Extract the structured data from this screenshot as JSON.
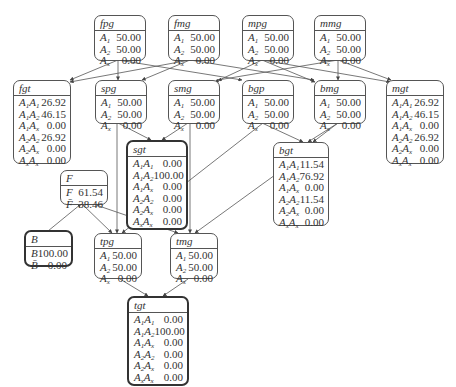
{
  "diagram": {
    "type": "bayesian-network",
    "nodes": {
      "fpg": {
        "title": "fpg",
        "rows": [
          {
            "label": "A1",
            "value": "50.00"
          },
          {
            "label": "A2",
            "value": "50.00"
          },
          {
            "label": "Ax",
            "value": "0.00"
          }
        ]
      },
      "fmg": {
        "title": "fmg",
        "rows": [
          {
            "label": "A1",
            "value": "50.00"
          },
          {
            "label": "A2",
            "value": "50.00"
          },
          {
            "label": "Ax",
            "value": "0.00"
          }
        ]
      },
      "mpg": {
        "title": "mpg",
        "rows": [
          {
            "label": "A1",
            "value": "50.00"
          },
          {
            "label": "A2",
            "value": "50.00"
          },
          {
            "label": "Ax",
            "value": "0.00"
          }
        ]
      },
      "mmg": {
        "title": "mmg",
        "rows": [
          {
            "label": "A1",
            "value": "50.00"
          },
          {
            "label": "A2",
            "value": "50.00"
          },
          {
            "label": "Ax",
            "value": "0.00"
          }
        ]
      },
      "fgt": {
        "title": "fgt",
        "rows": [
          {
            "label": "A1A1",
            "value": "26.92"
          },
          {
            "label": "A1A2",
            "value": "46.15"
          },
          {
            "label": "A1Ax",
            "value": "0.00"
          },
          {
            "label": "A2A2",
            "value": "26.92"
          },
          {
            "label": "A2Ax",
            "value": "0.00"
          },
          {
            "label": "AxAx",
            "value": "0.00"
          }
        ]
      },
      "spg": {
        "title": "spg",
        "rows": [
          {
            "label": "A1",
            "value": "50.00"
          },
          {
            "label": "A2",
            "value": "50.00"
          },
          {
            "label": "Ax",
            "value": "0.00"
          }
        ]
      },
      "smg": {
        "title": "smg",
        "rows": [
          {
            "label": "A1",
            "value": "50.00"
          },
          {
            "label": "A2",
            "value": "50.00"
          },
          {
            "label": "Ax",
            "value": "0.00"
          }
        ]
      },
      "bgp": {
        "title": "bgp",
        "rows": [
          {
            "label": "A1",
            "value": "50.00"
          },
          {
            "label": "A2",
            "value": "50.00"
          },
          {
            "label": "Ax",
            "value": "0.00"
          }
        ]
      },
      "bmg": {
        "title": "bmg",
        "rows": [
          {
            "label": "A1",
            "value": "50.00"
          },
          {
            "label": "A2",
            "value": "50.00"
          },
          {
            "label": "Ax",
            "value": "0.00"
          }
        ]
      },
      "mgt": {
        "title": "mgt",
        "rows": [
          {
            "label": "A1A1",
            "value": "26.92"
          },
          {
            "label": "A1A2",
            "value": "46.15"
          },
          {
            "label": "A1Ax",
            "value": "0.00"
          },
          {
            "label": "A2A2",
            "value": "26.92"
          },
          {
            "label": "A2Ax",
            "value": "0.00"
          },
          {
            "label": "AxAx",
            "value": "0.00"
          }
        ]
      },
      "sgt": {
        "title": "sgt",
        "rows": [
          {
            "label": "A1A1",
            "value": "0.00"
          },
          {
            "label": "A1A2",
            "value": "100.00"
          },
          {
            "label": "A1Ax",
            "value": "0.00"
          },
          {
            "label": "A2A2",
            "value": "0.00"
          },
          {
            "label": "A2Ax",
            "value": "0.00"
          },
          {
            "label": "AxAx",
            "value": "0.00"
          }
        ]
      },
      "bgt": {
        "title": "bgt",
        "rows": [
          {
            "label": "A1A1",
            "value": "11.54"
          },
          {
            "label": "A1A2",
            "value": "76.92"
          },
          {
            "label": "A1Ax",
            "value": "0.00"
          },
          {
            "label": "A2A2",
            "value": "11.54"
          },
          {
            "label": "A2Ax",
            "value": "0.00"
          },
          {
            "label": "AxAx",
            "value": "0.00"
          }
        ]
      },
      "F": {
        "title": "F",
        "rows": [
          {
            "label": "F",
            "value": "61.54"
          },
          {
            "label": "F̄",
            "value": "38.46"
          }
        ]
      },
      "B": {
        "title": "B",
        "rows": [
          {
            "label": "B",
            "value": "100.00"
          },
          {
            "label": "B̄",
            "value": "0.00"
          }
        ]
      },
      "tpg": {
        "title": "tpg",
        "rows": [
          {
            "label": "A1",
            "value": "50.00"
          },
          {
            "label": "A2",
            "value": "50.00"
          },
          {
            "label": "Ax",
            "value": "0.00"
          }
        ]
      },
      "tmg": {
        "title": "tmg",
        "rows": [
          {
            "label": "A1",
            "value": "50.00"
          },
          {
            "label": "A2",
            "value": "50.00"
          },
          {
            "label": "Ax",
            "value": "0.00"
          }
        ]
      },
      "tgt": {
        "title": "tgt",
        "rows": [
          {
            "label": "A1A1",
            "value": "0.00"
          },
          {
            "label": "A1A2",
            "value": "100.00"
          },
          {
            "label": "A1Ax",
            "value": "0.00"
          },
          {
            "label": "A2A2",
            "value": "0.00"
          },
          {
            "label": "A2Ax",
            "value": "0.00"
          },
          {
            "label": "AxAx",
            "value": "0.00"
          }
        ]
      }
    },
    "evidence_nodes": [
      "sgt",
      "B",
      "tgt"
    ],
    "edges": [
      [
        "fpg",
        "fgt"
      ],
      [
        "fpg",
        "spg"
      ],
      [
        "fpg",
        "bgp"
      ],
      [
        "fmg",
        "fgt"
      ],
      [
        "fmg",
        "spg"
      ],
      [
        "fmg",
        "bmg"
      ],
      [
        "mpg",
        "smg"
      ],
      [
        "mpg",
        "bmg"
      ],
      [
        "mpg",
        "mgt"
      ],
      [
        "mmg",
        "smg"
      ],
      [
        "mmg",
        "bgp"
      ],
      [
        "mmg",
        "mgt"
      ],
      [
        "spg",
        "sgt"
      ],
      [
        "smg",
        "sgt"
      ],
      [
        "bgp",
        "bgt"
      ],
      [
        "bmg",
        "bgt"
      ],
      [
        "spg",
        "tpg"
      ],
      [
        "bgp",
        "tpg"
      ],
      [
        "smg",
        "tmg"
      ],
      [
        "bgt",
        "tmg"
      ],
      [
        "B",
        "F"
      ],
      [
        "F",
        "tpg"
      ],
      [
        "F",
        "tmg"
      ],
      [
        "tpg",
        "tgt"
      ],
      [
        "tmg",
        "tgt"
      ]
    ]
  }
}
